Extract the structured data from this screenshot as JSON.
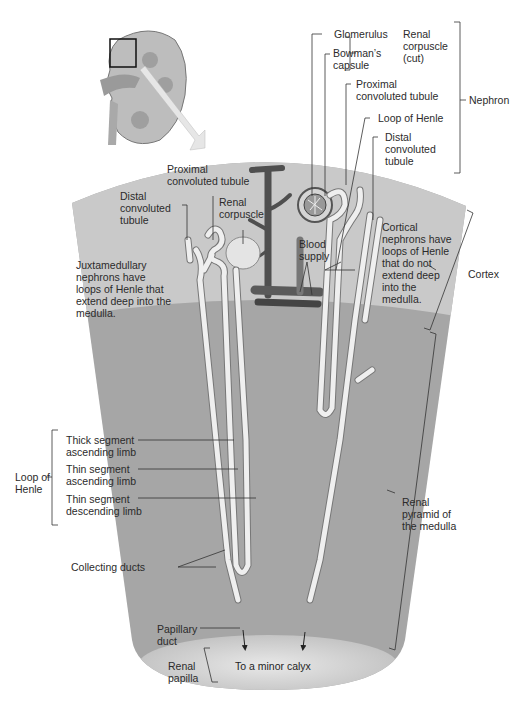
{
  "colors": {
    "cortex": "#c9c9c9",
    "medulla": "#a6a6a6",
    "tubule": "#efefef",
    "vessel": "#555555",
    "line": "#333333",
    "text": "#2b2b2b"
  },
  "labels": {
    "glomerulus": [
      "Glomerulus"
    ],
    "bowmans_capsule": [
      "Bowman’s",
      "capsule"
    ],
    "renal_corpuscle_cut": [
      "Renal",
      "corpuscle",
      "(cut)"
    ],
    "proximal_right": [
      "Proximal",
      "convoluted tubule"
    ],
    "loop_of_henle_top": [
      "Loop of Henle"
    ],
    "distal_right": [
      "Distal",
      "convoluted",
      "tubule"
    ],
    "nephron": [
      "Nephron"
    ],
    "proximal_left": [
      "Proximal",
      "convoluted tubule"
    ],
    "distal_left": [
      "Distal",
      "convoluted",
      "tubule"
    ],
    "renal_corpuscle": [
      "Renal",
      "corpuscle"
    ],
    "blood_supply": [
      "Blood",
      "supply"
    ],
    "juxtamedullary": [
      "Juxtamedullary",
      "nephrons have",
      "loops of Henle that",
      "extend deep into the",
      "medulla."
    ],
    "cortical": [
      "Cortical",
      "nephrons have",
      "loops of Henle",
      "that do not",
      "extend deep",
      "into the",
      "medulla."
    ],
    "cortex": [
      "Cortex"
    ],
    "loop_of_henle_left": [
      "Loop of",
      "Henle"
    ],
    "thick_ascending": [
      "Thick segment",
      "ascending limb"
    ],
    "thin_ascending": [
      "Thin segment",
      "ascending limb"
    ],
    "thin_descending": [
      "Thin segment",
      "descending limb"
    ],
    "renal_pyramid": [
      "Renal",
      "pyramid of",
      "the medulla"
    ],
    "collecting_ducts": [
      "Collecting ducts"
    ],
    "papillary_duct": [
      "Papillary",
      "duct"
    ],
    "renal_papilla": [
      "Renal",
      "papilla"
    ],
    "minor_calyx": [
      "To a minor calyx"
    ]
  }
}
